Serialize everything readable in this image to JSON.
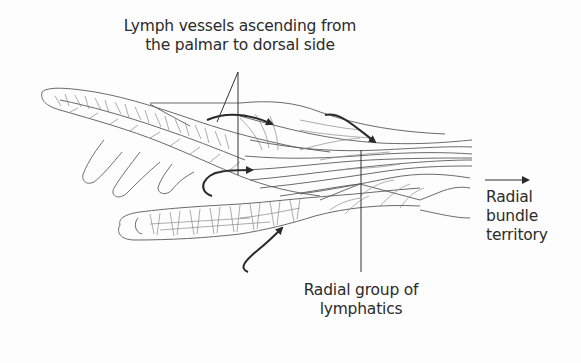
{
  "figure": {
    "background_color": "#fdfdfd",
    "line_color": "#555555",
    "arrow_color": "#2a2a2a"
  },
  "labels": {
    "top": {
      "line1": "Lymph vessels ascending from",
      "line2": "the palmar to dorsal side"
    },
    "right": {
      "line1": "Radial",
      "line2": "bundle",
      "line3": "territory"
    },
    "bottom": {
      "line1": "Radial group of",
      "line2": "lymphatics"
    }
  },
  "icons": {
    "right_arrow": "arrow-right-icon",
    "curved_arrows": [
      "curved-arrow-icon",
      "curved-arrow-icon",
      "curved-arrow-icon",
      "curved-arrow-icon"
    ]
  }
}
